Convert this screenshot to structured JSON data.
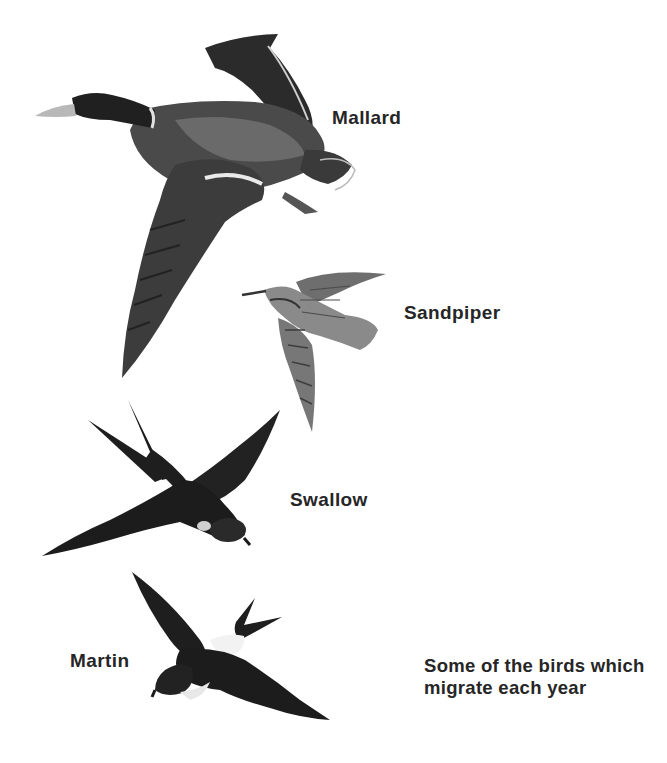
{
  "figure": {
    "birds": [
      {
        "id": "mallard",
        "label": "Mallard",
        "icon": "mallard-illustration"
      },
      {
        "id": "sandpiper",
        "label": "Sandpiper",
        "icon": "sandpiper-illustration"
      },
      {
        "id": "swallow",
        "label": "Swallow",
        "icon": "swallow-illustration"
      },
      {
        "id": "martin",
        "label": "Martin",
        "icon": "martin-illustration"
      }
    ],
    "caption": "Some of the birds which migrate each year"
  },
  "colors": {
    "background": "#ffffff",
    "text": "#262626",
    "dark_plumage": "#1e1e1e",
    "mid_plumage": "#5a5a5a",
    "light_plumage": "#b5b5b5"
  }
}
